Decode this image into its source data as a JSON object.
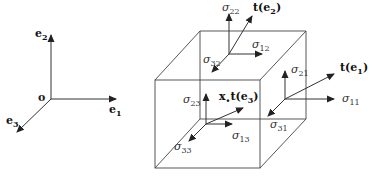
{
  "diagram": {
    "type": "stress-cube",
    "colors": {
      "line": "#333333",
      "background": "#ffffff"
    },
    "basis": {
      "origin_label": "o",
      "e1": "e",
      "e1_sub": "1",
      "e2": "e",
      "e2_sub": "2",
      "e3": "e",
      "e3_sub": "3"
    },
    "cube": {
      "point_label": "x",
      "traction_e1": "t(e",
      "traction_e1_sub": "1",
      "traction_e1_close": ")",
      "traction_e2": "t(e",
      "traction_e2_sub": "2",
      "traction_e2_close": ")",
      "traction_e3": "t(e",
      "traction_e3_sub": "3",
      "traction_e3_close": ")",
      "stresses": {
        "s11": {
          "sym": "σ",
          "sub": "11"
        },
        "s21": {
          "sym": "σ",
          "sub": "21"
        },
        "s31": {
          "sym": "σ",
          "sub": "31"
        },
        "s12": {
          "sym": "σ",
          "sub": "12"
        },
        "s22": {
          "sym": "σ",
          "sub": "22"
        },
        "s32": {
          "sym": "σ",
          "sub": "32"
        },
        "s13": {
          "sym": "σ",
          "sub": "13"
        },
        "s23": {
          "sym": "σ",
          "sub": "23"
        },
        "s33": {
          "sym": "σ",
          "sub": "33"
        }
      }
    }
  }
}
